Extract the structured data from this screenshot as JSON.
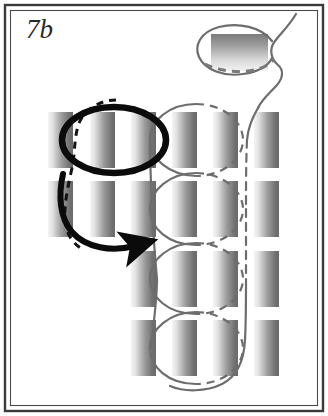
{
  "figure": {
    "label": "7b",
    "caption_text": "7b",
    "panel_width": 328,
    "panel_height": 416,
    "background_color": "#ffffff",
    "border": {
      "color": "#3a3a3a",
      "outer_inset": 4,
      "inner_inset": 9,
      "outer_stroke_width": 2,
      "inner_stroke_width": 1.2
    }
  },
  "colors": {
    "block_gradient_light": "#f2f2f2",
    "block_gradient_dark": "#6e6e6e",
    "bold_stroke": "#0b0b0b",
    "dashed_black_stroke": "#121212",
    "gray_stroke": "#6d6d6d",
    "label_color": "#2a2a2a"
  },
  "blocks": {
    "name": "gradient-block",
    "width": 25,
    "height": 56,
    "gradient_direction": "left-to-right",
    "rows": [
      {
        "row_index": 1,
        "y": 112,
        "x_positions": [
          48,
          90,
          131,
          172,
          213,
          254
        ]
      },
      {
        "row_index": 2,
        "y": 181,
        "x_positions": [
          48,
          90,
          131,
          172,
          213,
          254
        ]
      },
      {
        "row_index": 3,
        "y": 251,
        "x_positions": [
          131,
          172,
          213,
          254
        ]
      },
      {
        "row_index": 4,
        "y": 320,
        "x_positions": [
          131,
          172,
          213,
          254
        ]
      }
    ],
    "total_count": 20
  },
  "top_block": {
    "name": "horizontal-gradient-block",
    "x": 211,
    "y": 34,
    "width": 57,
    "height": 37,
    "gradient_direction": "top-to-bottom"
  },
  "bold_loop": {
    "name": "bold-black-ellipse",
    "center_x": 114,
    "center_y": 140,
    "radius_x": 52,
    "radius_y": 33,
    "stroke_width": 6.5,
    "stroke_color": "#0b0b0b"
  },
  "bold_arrow": {
    "name": "bold-black-arrow",
    "stroke_width": 6,
    "stroke_color": "#0b0b0b",
    "tip_x": 143,
    "tip_y": 246,
    "direction": "curves-down-left-then-right"
  },
  "dashed_black_path": {
    "name": "black-dashed-trajectory",
    "stroke_width": 3,
    "dash_pattern": "7 6",
    "stroke_color": "#121212"
  },
  "gray_paths": {
    "name": "gray-thread-trajectory",
    "stroke_width": 2.2,
    "dash_pattern": "7 6",
    "stroke_color": "#6d6d6d",
    "loops": [
      {
        "id": "top-right-loop",
        "center_x": 242,
        "center_y": 52,
        "radius_x": 46,
        "radius_y": 30
      },
      {
        "id": "row1-loop",
        "center_x": 196,
        "center_y": 140,
        "radius_x": 47,
        "radius_y": 36
      },
      {
        "id": "row2-loop",
        "center_x": 196,
        "center_y": 209,
        "radius_x": 47,
        "radius_y": 36
      },
      {
        "id": "row3-loop",
        "center_x": 196,
        "center_y": 279,
        "radius_x": 47,
        "radius_y": 36
      },
      {
        "id": "row4-loop",
        "center_x": 196,
        "center_y": 348,
        "radius_x": 47,
        "radius_y": 36
      }
    ],
    "right_descender_x": 246,
    "left_descender_x": 150
  }
}
